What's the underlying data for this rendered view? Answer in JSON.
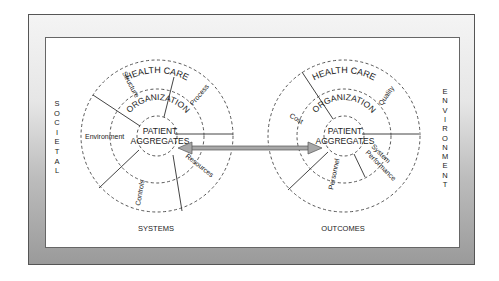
{
  "side_labels": {
    "left": "SOCIETAL",
    "right": "ENVIRONMENT"
  },
  "left_model": {
    "title": "SYSTEMS",
    "rings": {
      "outer": "HEALTH CARE",
      "middle": "ORGANIZATION",
      "inner_line1": "PATIENT",
      "inner_line2": "AGGREGATES"
    },
    "segments": [
      "Structure",
      "Process",
      "Resources",
      "Controls",
      "Environment"
    ]
  },
  "right_model": {
    "title": "OUTCOMES",
    "rings": {
      "outer": "HEALTH CARE",
      "middle": "ORGANIZATION",
      "inner_line1": "PATIENT",
      "inner_line2": "AGGREGATES"
    },
    "segments": [
      "Cost",
      "Quality",
      "System",
      "Performance",
      "Personnel"
    ]
  },
  "connector": {
    "type": "double-headed-arrow",
    "color": "#9a9a9a"
  },
  "colors": {
    "frame_light": "#f4f4f4",
    "frame_dark": "#9a9a9a",
    "line": "#444444"
  }
}
